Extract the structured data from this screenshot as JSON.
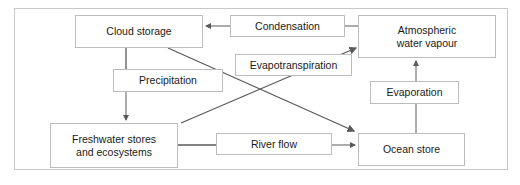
{
  "diagram": {
    "stores": {
      "cloud": "Cloud storage",
      "atmosphere_line1": "Atmospheric",
      "atmosphere_line2": "water vapour",
      "freshwater_line1": "Freshwater stores",
      "freshwater_line2": "and ecosystems",
      "ocean": "Ocean store"
    },
    "processes": {
      "condensation": "Condensation",
      "precipitation": "Precipitation",
      "evapotranspiration": "Evapotranspiration",
      "evaporation": "Evaporation",
      "river_flow": "River flow"
    },
    "flows": [
      {
        "from": "Atmospheric water vapour",
        "to": "Cloud storage",
        "via": "Condensation"
      },
      {
        "from": "Cloud storage",
        "to": "Freshwater stores and ecosystems",
        "via": "Precipitation"
      },
      {
        "from": "Cloud storage",
        "to": "Ocean store",
        "via": "Precipitation"
      },
      {
        "from": "Freshwater stores and ecosystems",
        "to": "Atmospheric water vapour",
        "via": "Evapotranspiration"
      },
      {
        "from": "Ocean store",
        "to": "Atmospheric water vapour",
        "via": "Evaporation"
      },
      {
        "from": "Freshwater stores and ecosystems",
        "to": "Ocean store",
        "via": "River flow"
      }
    ],
    "colors": {
      "line": "#5a5a5a",
      "box_border": "#bdbdbd",
      "frame_border": "#c8c8c8"
    }
  }
}
